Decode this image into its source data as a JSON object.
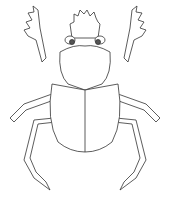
{
  "illustration": {
    "subject": "scarab beetle line drawing",
    "stroke_color": "#333333",
    "fill_color": "#ffffff",
    "eye_color": "#555555"
  }
}
